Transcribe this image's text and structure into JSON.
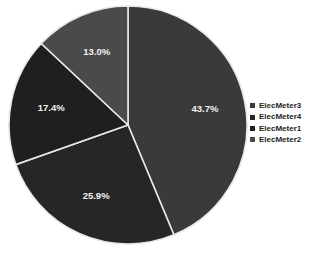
{
  "chart_data": {
    "type": "pie",
    "title": "",
    "categories": [
      "ElecMeter3",
      "ElecMeter4",
      "ElecMeter1",
      "ElecMeter2"
    ],
    "values": [
      43.7,
      25.9,
      17.4,
      13.0
    ],
    "labels": [
      "43.7%",
      "25.9%",
      "17.4%",
      "13.0%"
    ],
    "colors": [
      "#3a3a3a",
      "#262626",
      "#1f1f1f",
      "#4a4a4a"
    ],
    "units": "percent",
    "start_angle_deg": 0,
    "direction": "clockwise",
    "legend_position": "right",
    "grid": false,
    "slices": [
      {
        "name": "ElecMeter3",
        "value": 43.7,
        "label": "43.7%",
        "color": "#3a3a3a"
      },
      {
        "name": "ElecMeter4",
        "value": 25.9,
        "label": "25.9%",
        "color": "#262626"
      },
      {
        "name": "ElecMeter1",
        "value": 17.4,
        "label": "17.4%",
        "color": "#1f1f1f"
      },
      {
        "name": "ElecMeter2",
        "value": 13.0,
        "label": "13.0%",
        "color": "#4a4a4a"
      }
    ]
  },
  "legend": {
    "items": [
      {
        "label": "ElecMeter3",
        "color": "#3a3a3a"
      },
      {
        "label": "ElecMeter4",
        "color": "#262626"
      },
      {
        "label": "ElecMeter1",
        "color": "#1f1f1f"
      },
      {
        "label": "ElecMeter2",
        "color": "#4a4a4a"
      }
    ]
  },
  "style": {
    "background": "#ffffff",
    "slice_border": "#e8e8e8",
    "label_text_color": "#f2f2f2",
    "legend_text_color": "#1d1d1d"
  }
}
